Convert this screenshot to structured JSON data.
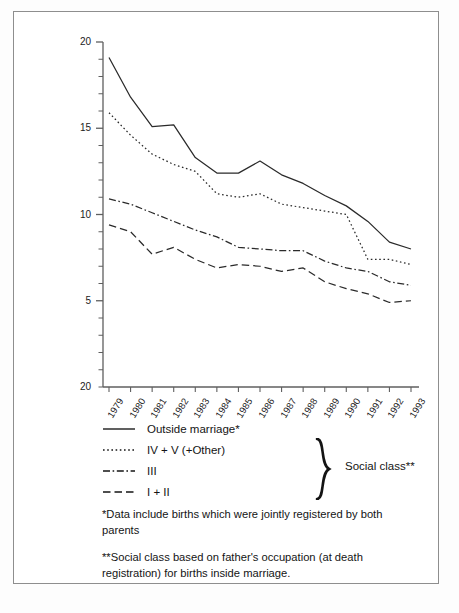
{
  "figure": {
    "y_axis_title": "Death rate per 1000 live births"
  },
  "chart_data": {
    "type": "line",
    "title": "",
    "xlabel": "",
    "ylabel": "Death rate per 1000 live births",
    "grid": false,
    "legend_position": "below-plot-left",
    "xlim": [
      1979,
      1993
    ],
    "ylim": [
      0,
      20
    ],
    "y_ticks": [
      20,
      15,
      10,
      5
    ],
    "y_tick_labels": [
      "20",
      "15",
      "10",
      "5"
    ],
    "y_axis_bottom_label": "20",
    "y_minor_ticks_per_unit": 1,
    "categories": [
      1979,
      1980,
      1981,
      1982,
      1983,
      1984,
      1985,
      1986,
      1987,
      1988,
      1989,
      1990,
      1991,
      1992,
      1993
    ],
    "x_tick_labels": [
      "1979",
      "1980",
      "1981",
      "1982",
      "1983",
      "1984",
      "1985",
      "1986",
      "1987",
      "1988",
      "1989",
      "1990",
      "1991",
      "1992",
      "1993"
    ],
    "series": [
      {
        "name": "Outside marriage*",
        "style": "solid",
        "values": [
          19.1,
          16.8,
          15.1,
          15.2,
          13.3,
          12.4,
          12.4,
          13.1,
          12.3,
          11.8,
          11.1,
          10.5,
          9.6,
          8.4,
          8.0
        ]
      },
      {
        "name": "IV + V (+Other)",
        "style": "dotted",
        "values": [
          15.9,
          14.6,
          13.5,
          12.9,
          12.5,
          11.2,
          11.0,
          11.2,
          10.6,
          10.4,
          10.2,
          10.0,
          7.4,
          7.4,
          7.1
        ]
      },
      {
        "name": "III",
        "style": "dashdot",
        "values": [
          10.9,
          10.6,
          10.1,
          9.6,
          9.1,
          8.7,
          8.1,
          8.0,
          7.9,
          7.9,
          7.3,
          6.9,
          6.7,
          6.1,
          5.9
        ]
      },
      {
        "name": "I + II",
        "style": "dashed",
        "values": [
          9.4,
          9.0,
          7.7,
          8.1,
          7.4,
          6.9,
          7.1,
          7.0,
          6.7,
          6.9,
          6.1,
          5.7,
          5.4,
          4.9,
          5.0
        ]
      }
    ]
  },
  "legend": {
    "items": [
      {
        "label": "Outside marriage*",
        "style": "solid"
      },
      {
        "label": "IV + V (+Other)",
        "style": "dotted"
      },
      {
        "label": "III",
        "style": "dashdot"
      },
      {
        "label": "I + II",
        "style": "dashed"
      }
    ],
    "group_label": "Social class**"
  },
  "footnotes": {
    "note_1": "*Data include births which were jointly registered by both parents",
    "note_2": "**Social class based on father's occupation (at death registration) for births inside marriage."
  }
}
